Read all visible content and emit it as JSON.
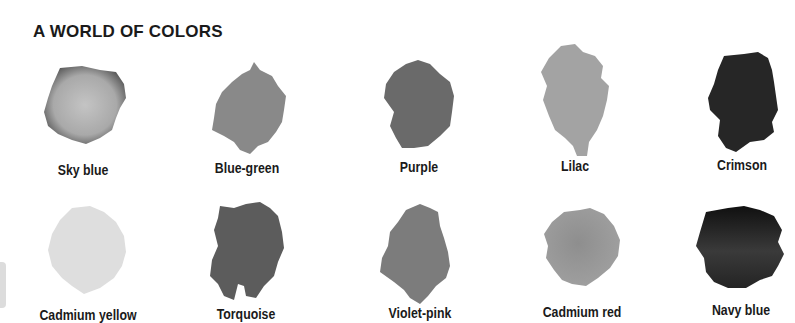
{
  "page": {
    "title": "A WORLD OF COLORS"
  },
  "swatches": [
    {
      "label": "Sky blue",
      "tone": "#a9a9a9",
      "edge": "#6f6f6f"
    },
    {
      "label": "Blue-green",
      "tone": "#878787",
      "edge": "#7a7a7a"
    },
    {
      "label": "Purple",
      "tone": "#6b6b6b",
      "edge": "#5e5e5e"
    },
    {
      "label": "Lilac",
      "tone": "#a2a2a2",
      "edge": "#979797"
    },
    {
      "label": "Crimson",
      "tone": "#2a2a2a",
      "edge": "#1e1e1e"
    },
    {
      "label": "Cadmium yellow",
      "tone": "#dedede",
      "edge": "#d6d6d6"
    },
    {
      "label": "Torquoise",
      "tone": "#5e5e5e",
      "edge": "#525252"
    },
    {
      "label": "Violet-pink",
      "tone": "#7e7e7e",
      "edge": "#727272"
    },
    {
      "label": "Cadmium red",
      "tone": "#969696",
      "edge": "#888888"
    },
    {
      "label": "Navy blue",
      "tone": "#3a3a3a",
      "edge": "#121212"
    }
  ]
}
